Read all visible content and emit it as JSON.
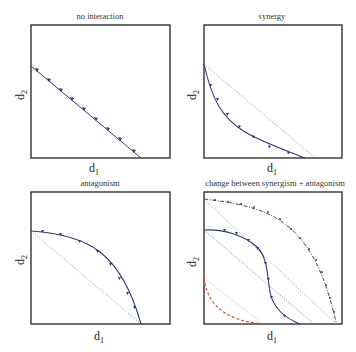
{
  "figure": {
    "panels": [
      {
        "id": "no-interaction",
        "title": "no interaction",
        "xlabel": "d",
        "xlabel_sub": "1",
        "ylabel": "d",
        "ylabel_sub": "2",
        "curves": [
          {
            "name": "isobole",
            "style": "solid-arrows",
            "color": "#2b3a7a",
            "shape": "straight line from y-axis intercept to x-axis intercept"
          }
        ]
      },
      {
        "id": "synergy",
        "title": "synergy",
        "xlabel": "d",
        "xlabel_sub": "1",
        "ylabel": "d",
        "ylabel_sub": "2",
        "curves": [
          {
            "name": "isobole",
            "style": "solid-arrows",
            "color": "#2b3a7a",
            "shape": "convex curve bowing below additivity line"
          },
          {
            "name": "additivity-reference",
            "style": "dotted",
            "color": "#888888"
          }
        ]
      },
      {
        "id": "antagonism",
        "title": "antagonism",
        "xlabel": "d",
        "xlabel_sub": "1",
        "ylabel": "d",
        "ylabel_sub": "2",
        "curves": [
          {
            "name": "isobole",
            "style": "solid-arrows",
            "color": "#2b3a7a",
            "shape": "concave curve bowing above additivity line"
          },
          {
            "name": "additivity-reference",
            "style": "dotted",
            "color": "#888888"
          }
        ]
      },
      {
        "id": "change-between",
        "title": "change between synergism + antagonism",
        "xlabel": "d",
        "xlabel_sub": "1",
        "ylabel": "d",
        "ylabel_sub": "2",
        "curves": [
          {
            "name": "outer-isobole",
            "style": "dash-dot",
            "color": "#333333",
            "shape": "concave (antagonism)"
          },
          {
            "name": "middle-isobole",
            "style": "solid-arrows",
            "color": "#2b3a7a",
            "shape": "S-shaped (antagonism then synergy)"
          },
          {
            "name": "inner-isobole",
            "style": "dashed",
            "color": "#d9472b",
            "shape": "convex (synergy)"
          },
          {
            "name": "outer-reference",
            "style": "dotted",
            "color": "#888888"
          },
          {
            "name": "middle-reference",
            "style": "dotted",
            "color": "#6670a8"
          },
          {
            "name": "inner-reference",
            "style": "dotted",
            "color": "#e8907a"
          }
        ]
      }
    ],
    "colors": {
      "axis": "#222222",
      "isobole_blue": "#2b3a7a",
      "reference_gray": "#888888",
      "red": "#d9472b"
    }
  }
}
